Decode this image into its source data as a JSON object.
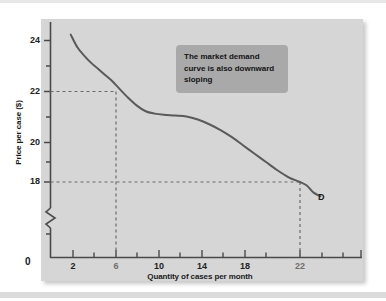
{
  "figure": {
    "panel_color": "#d6d6d6",
    "curve_color": "#5a5a5a",
    "annotation_bg": "#a9a9a9"
  },
  "annotation": {
    "text": "The market demand curve is also downward sloping"
  },
  "chart_data": {
    "type": "line",
    "title": "",
    "xlabel": "Quantity of cases per month",
    "ylabel": "Price per case ($)",
    "xlim": [
      0,
      26
    ],
    "ylim": [
      17.2,
      24.6
    ],
    "grid": false,
    "legend": "none",
    "axis_break_y": true,
    "origin_label": "0",
    "xticks_labeled": [
      2,
      6,
      10,
      14,
      18,
      22
    ],
    "xticks_minor": [
      4,
      8,
      12,
      16,
      20,
      24,
      26
    ],
    "yticks_labeled": [
      24,
      22,
      20,
      18
    ],
    "yticks_minor": [
      23,
      21,
      19
    ],
    "series": [
      {
        "name": "D",
        "label": "D",
        "x": [
          1.8,
          2.4,
          3.0,
          3.6,
          4.2,
          4.8,
          5.4,
          6.0,
          6.8,
          7.6,
          8.4,
          9.2,
          10.0,
          11.0,
          12.0,
          13.0,
          14.0,
          15.0,
          16.0,
          17.0,
          18.0,
          19.0,
          20.0,
          21.0,
          22.0,
          22.6,
          23.2,
          23.8
        ],
        "y": [
          24.25,
          23.7,
          23.35,
          23.05,
          22.8,
          22.55,
          22.3,
          22.0,
          21.6,
          21.25,
          21.0,
          20.9,
          20.85,
          20.82,
          20.78,
          20.65,
          20.45,
          20.2,
          19.9,
          19.55,
          19.2,
          18.85,
          18.5,
          18.2,
          18.0,
          17.85,
          17.55,
          17.4
        ]
      }
    ],
    "guides": [
      {
        "name": "price-22-guide",
        "price": 22,
        "quantity": 6
      },
      {
        "name": "price-18-guide",
        "price": 18,
        "quantity": 22
      }
    ]
  },
  "ticks": {
    "x": [
      {
        "value": "2",
        "labeled": true,
        "dim": false
      },
      {
        "value": "6",
        "labeled": true,
        "dim": true
      },
      {
        "value": "10",
        "labeled": true,
        "dim": false
      },
      {
        "value": "14",
        "labeled": true,
        "dim": false
      },
      {
        "value": "18",
        "labeled": true,
        "dim": false
      },
      {
        "value": "22",
        "labeled": true,
        "dim": true
      }
    ],
    "y": [
      {
        "value": "24",
        "labeled": true
      },
      {
        "value": "22",
        "labeled": true
      },
      {
        "value": "20",
        "labeled": true
      },
      {
        "value": "18",
        "labeled": true
      }
    ]
  },
  "labels": {
    "y_axis_title": "Price per case ($)",
    "x_axis_title": "Quantity of cases per month",
    "origin": "0",
    "curve": "D",
    "y_24": "24",
    "y_22": "22",
    "y_20": "20",
    "y_18": "18",
    "x_2": "2",
    "x_6": "6",
    "x_10": "10",
    "x_14": "14",
    "x_18": "18",
    "x_22": "22"
  }
}
